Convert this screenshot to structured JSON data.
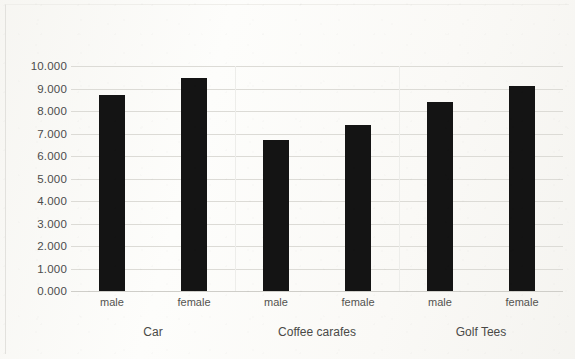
{
  "chart_data": {
    "type": "bar",
    "title": "",
    "subtitle": "",
    "xlabel": "",
    "ylabel": "",
    "ylim": [
      0,
      10
    ],
    "grid": true,
    "legend": "none",
    "orientation": "vertical",
    "bar_color": "#141414",
    "gridline_color": "#dcdbd6",
    "text_color": "#4c4c4c",
    "background_color": "#fbfbf9",
    "y_ticks": [
      "0.000",
      "1.000",
      "2.000",
      "3.000",
      "4.000",
      "5.000",
      "6.000",
      "7.000",
      "8.000",
      "9.000",
      "10.000"
    ],
    "y_tick_values": [
      0,
      1,
      2,
      3,
      4,
      5,
      6,
      7,
      8,
      9,
      10
    ],
    "categories": [
      "male",
      "female",
      "male",
      "female",
      "male",
      "female"
    ],
    "groups": [
      {
        "label": "Car",
        "members": [
          "male",
          "female"
        ]
      },
      {
        "label": "Coffee carafes",
        "members": [
          "male",
          "female"
        ]
      },
      {
        "label": "Golf Tees",
        "members": [
          "male",
          "female"
        ]
      }
    ],
    "group_labels": [
      "Car",
      "Coffee carafes",
      "Golf Tees"
    ],
    "values": [
      8.7,
      9.45,
      6.7,
      7.4,
      8.4,
      9.1
    ],
    "bars": [
      {
        "group": "Car",
        "category": "male",
        "value": 8.7
      },
      {
        "group": "Car",
        "category": "female",
        "value": 9.45
      },
      {
        "group": "Coffee carafes",
        "category": "male",
        "value": 6.7
      },
      {
        "group": "Coffee carafes",
        "category": "female",
        "value": 7.4
      },
      {
        "group": "Golf Tees",
        "category": "male",
        "value": 8.4
      },
      {
        "group": "Golf Tees",
        "category": "female",
        "value": 9.1
      }
    ]
  }
}
